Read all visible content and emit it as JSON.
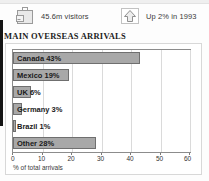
{
  "stats": [
    {
      "icon": "suitcase-icon",
      "label": "45.6m visitors"
    },
    {
      "icon": "up-arrow-icon",
      "label": "Up 2% in 1993"
    }
  ],
  "chart_data": {
    "type": "bar",
    "orientation": "horizontal",
    "title": "MAIN OVERSEAS ARRIVALS",
    "categories": [
      "Canada",
      "Mexico",
      "UK",
      "Germany",
      "Brazil",
      "Other"
    ],
    "values": [
      43,
      19,
      6,
      3,
      1,
      28
    ],
    "bar_labels": [
      "Canada 43%",
      "Mexico 19%",
      "UK 6%",
      "Germany 3%",
      "Brazil 1%",
      "Other 28%"
    ],
    "xlabel": "% of total arrivals",
    "ylabel": "",
    "xlim": [
      0,
      60
    ],
    "xticks": [
      0,
      10,
      20,
      30,
      40,
      50,
      60
    ],
    "xtick_labels": [
      "0",
      "10",
      "20",
      "30",
      "40",
      "50",
      "60"
    ],
    "grid": true,
    "legend": "none",
    "bar_color": "#a8a8a8",
    "bar_border_color": "#6f6f6f"
  }
}
